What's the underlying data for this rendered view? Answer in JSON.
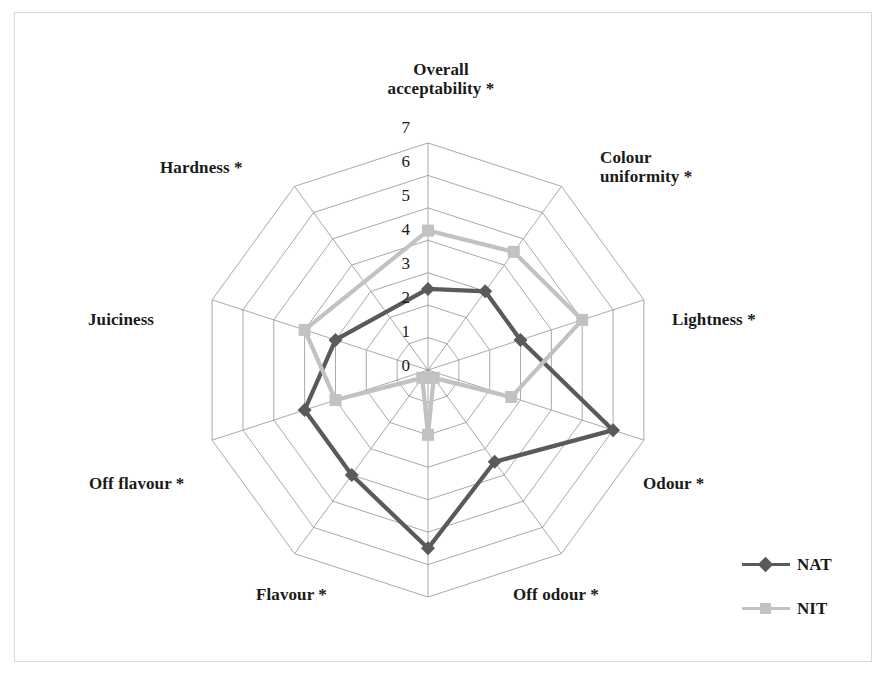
{
  "chart_data": {
    "type": "radar",
    "title": "",
    "categories": [
      "Overall\nacceptability *",
      "Colour\nuniformity *",
      "Lightness *",
      "Odour *",
      "Off odour *",
      "Flavour *",
      "Off flavour *",
      "Juiciness",
      "Hardness *"
    ],
    "series": [
      {
        "name": "NAT",
        "color": "#5a5a5a",
        "marker": "diamond",
        "values": [
          2.5,
          3.0,
          3.0,
          6.0,
          3.5,
          5.5,
          4.0,
          4.0,
          3.0
        ]
      },
      {
        "name": "NIT",
        "color": "#c2c2c2",
        "marker": "square",
        "values": [
          4.3,
          4.5,
          5.0,
          2.7,
          0.3,
          2.0,
          0.3,
          3.0,
          4.0
        ]
      }
    ],
    "radial_ticks": [
      "7",
      "6",
      "5",
      "4",
      "3",
      "2",
      "1",
      "0"
    ],
    "radial_tick_values": [
      7,
      6,
      5,
      4,
      3,
      2,
      1,
      0
    ],
    "rlim": [
      0,
      7
    ],
    "grid": true,
    "grid_shape": "polygon",
    "grid_color": "#9a9a9a",
    "legend_position": "bottom-right",
    "background": "#ffffff",
    "frame_color": "#d9d9d9"
  },
  "axis_labels": [
    {
      "text": "Overall\nacceptability *",
      "x": 366,
      "y": 60,
      "align": "center",
      "width": 150
    },
    {
      "text": "Colour\nuniformity *",
      "x": 600,
      "y": 148,
      "align": "left",
      "width": 150
    },
    {
      "text": "Lightness *",
      "x": 672,
      "y": 310,
      "align": "left",
      "width": 130
    },
    {
      "text": "Odour *",
      "x": 643,
      "y": 474,
      "align": "left",
      "width": 110
    },
    {
      "text": "Off odour *",
      "x": 513,
      "y": 585,
      "align": "left",
      "width": 130
    },
    {
      "text": "Flavour *",
      "x": 256,
      "y": 585,
      "align": "left",
      "width": 110
    },
    {
      "text": "Off flavour *",
      "x": 89,
      "y": 474,
      "align": "left",
      "width": 140
    },
    {
      "text": "Juiciness",
      "x": 88,
      "y": 310,
      "align": "left",
      "width": 110
    },
    {
      "text": "Hardness *",
      "x": 160,
      "y": 158,
      "align": "left",
      "width": 130
    }
  ],
  "tick_labels": [
    {
      "text": "7",
      "x": 384,
      "y": 118
    },
    {
      "text": "6",
      "x": 384,
      "y": 152
    },
    {
      "text": "5",
      "x": 384,
      "y": 186
    },
    {
      "text": "4",
      "x": 384,
      "y": 220
    },
    {
      "text": "3",
      "x": 384,
      "y": 254
    },
    {
      "text": "2",
      "x": 384,
      "y": 288
    },
    {
      "text": "1",
      "x": 384,
      "y": 322
    },
    {
      "text": "0",
      "x": 384,
      "y": 356
    }
  ],
  "legend": {
    "items": [
      {
        "label": "NAT",
        "color": "#5a5a5a",
        "marker": "diamond"
      },
      {
        "label": "NIT",
        "color": "#c2c2c2",
        "marker": "square"
      }
    ]
  },
  "geometry": {
    "center_x": 428,
    "center_y": 370,
    "radius": 227,
    "axis_count": 10,
    "ring_count": 7,
    "start_angle_deg": -90
  }
}
